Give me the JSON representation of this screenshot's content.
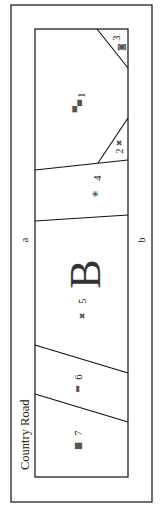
{
  "diagram": {
    "type": "plat-map",
    "orientation": "rotated-90-ccw",
    "road_label": "Country Road",
    "block_label": "B",
    "edge_labels": {
      "top_edge": "a",
      "bottom_edge": "b"
    },
    "lots": [
      {
        "number": "1",
        "icon": "building-icon"
      },
      {
        "number": "2",
        "icon": "tree-icon"
      },
      {
        "number": "3",
        "icon": "house-icon"
      },
      {
        "number": "4",
        "icon": "garden-icon"
      },
      {
        "number": "5",
        "icon": "tree-icon"
      },
      {
        "number": "6",
        "icon": "fence-icon"
      },
      {
        "number": "7",
        "icon": "barn-icon"
      }
    ],
    "icon_glyphs": {
      "building-icon": "▀▄",
      "tree-icon": "✖",
      "house-icon": "◙",
      "garden-icon": "❀",
      "fence-icon": "▬",
      "barn-icon": "▆"
    },
    "colors": {
      "line": "#111111",
      "background": "#ffffff",
      "text": "#222222"
    }
  }
}
